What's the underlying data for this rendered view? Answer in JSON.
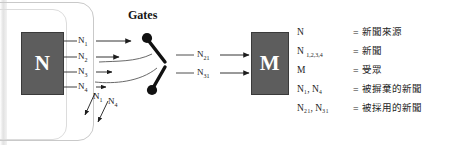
{
  "diagram": {
    "title": "Gates",
    "source_node": {
      "label": "N",
      "name": "news-source-node"
    },
    "audience_node": {
      "label": "M",
      "name": "audience-node"
    },
    "input_flows": [
      {
        "label": "N",
        "sub": "1"
      },
      {
        "label": "N",
        "sub": "2"
      },
      {
        "label": "N",
        "sub": "3"
      },
      {
        "label": "N",
        "sub": "4"
      }
    ],
    "rejected_flows": [
      {
        "label": "N",
        "sub": "1"
      },
      {
        "label": "N",
        "sub": "4"
      }
    ],
    "output_flows": [
      {
        "label": "N",
        "sub": "21"
      },
      {
        "label": "N",
        "sub": "31"
      }
    ]
  },
  "legend": {
    "rows": [
      {
        "symbol": "N",
        "sub": "",
        "eq": "=",
        "definition": "新聞來源"
      },
      {
        "symbol": "N",
        "sub": "1,2,3,4",
        "eq": "=",
        "definition": "新聞"
      },
      {
        "symbol": "M",
        "sub": "",
        "eq": "=",
        "definition": "受眾"
      },
      {
        "symbol": "N₁,  N₄",
        "sub": "",
        "eq": "=",
        "definition": "被摒棄的新聞"
      },
      {
        "symbol": "N₂₁, N₃₁",
        "sub": "",
        "eq": "=",
        "definition": "被採用的新聞"
      }
    ]
  },
  "colors": {
    "node_fill": "#5d5d5d",
    "node_text": "#ffffff",
    "stroke": "#3a3a3a",
    "gate_fill": "#111111",
    "page_background": "#ffffff"
  }
}
